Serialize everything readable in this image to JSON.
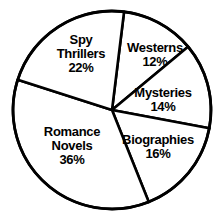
{
  "chart_data": {
    "type": "pie",
    "title": "",
    "subtitle": "",
    "xlabel": "",
    "ylabel": "",
    "grid": false,
    "legend_position": "none",
    "units": "percent",
    "total": 100,
    "categories": [
      "Westerns",
      "Mysteries",
      "Biographies",
      "Romance Novels",
      "Spy Thrillers"
    ],
    "values": [
      12,
      14,
      16,
      36,
      22
    ],
    "slices": [
      {
        "name": "Westerns",
        "label_lines": [
          "Westerns"
        ],
        "value": 12,
        "percent_label": "12%",
        "start_angle": 7,
        "end_angle": 50.2,
        "fill": "#ffffff",
        "stroke": "#000000",
        "label_x": 155,
        "label_y": 55
      },
      {
        "name": "Mysteries",
        "label_lines": [
          "Mysteries"
        ],
        "value": 14,
        "percent_label": "14%",
        "start_angle": 50.2,
        "end_angle": 100.6,
        "fill": "#ffffff",
        "stroke": "#000000",
        "label_x": 163,
        "label_y": 100
      },
      {
        "name": "Biographies",
        "label_lines": [
          "Biographies"
        ],
        "value": 16,
        "percent_label": "16%",
        "start_angle": 100.6,
        "end_angle": 158.2,
        "fill": "#ffffff",
        "stroke": "#000000",
        "label_x": 158,
        "label_y": 147
      },
      {
        "name": "Romance Novels",
        "label_lines": [
          "Romance",
          "Novels"
        ],
        "value": 36,
        "percent_label": "36%",
        "start_angle": 158.2,
        "end_angle": 287.8,
        "fill": "#ffffff",
        "stroke": "#000000",
        "label_x": 72,
        "label_y": 146
      },
      {
        "name": "Spy Thrillers",
        "label_lines": [
          "Spy",
          "Thrillers"
        ],
        "value": 22,
        "percent_label": "22%",
        "start_angle": 287.8,
        "end_angle": 367,
        "fill": "#ffffff",
        "stroke": "#000000",
        "label_x": 81,
        "label_y": 54
      }
    ],
    "geometry": {
      "center_x": 112,
      "center_y": 110,
      "radius": 99
    },
    "colors": {
      "background": "#ffffff",
      "stroke": "#000000",
      "text": "#000000"
    }
  }
}
